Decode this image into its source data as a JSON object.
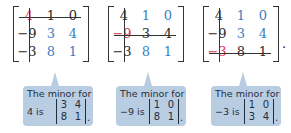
{
  "matrices": [
    {
      "rows": [
        [
          "4",
          "1",
          "0"
        ],
        [
          "-9",
          "3",
          "4"
        ],
        [
          "-3",
          "8",
          "1"
        ]
      ],
      "highlight": {
        "row": 0,
        "col": 0,
        "value": "4"
      },
      "crossed_row": 0,
      "crossed_col": 0
    },
    {
      "rows": [
        [
          "4",
          "1",
          "0"
        ],
        [
          "-9",
          "3",
          "4"
        ],
        [
          "-3",
          "8",
          "1"
        ]
      ],
      "highlight": {
        "row": 1,
        "col": 0,
        "value": "-9"
      },
      "crossed_row": 1,
      "crossed_col": 0
    },
    {
      "rows": [
        [
          "4",
          "1",
          "0"
        ],
        [
          "-9",
          "3",
          "4"
        ],
        [
          "-3",
          "8",
          "1"
        ]
      ],
      "highlight": {
        "row": 2,
        "col": 0,
        "value": "-3"
      },
      "crossed_row": 2,
      "crossed_col": 0,
      "trailing_punctuation": "."
    }
  ],
  "callouts": [
    {
      "title": "The minor for",
      "lead": "4 is",
      "minor": [
        [
          "3",
          "4"
        ],
        [
          "8",
          "1"
        ]
      ],
      "punctuation": "."
    },
    {
      "title": "The minor for",
      "lead": "−9 is",
      "minor": [
        [
          "1",
          "0"
        ],
        [
          "8",
          "1"
        ]
      ],
      "punctuation": "."
    },
    {
      "title": "The minor for",
      "lead": "−3 is",
      "minor": [
        [
          "1",
          "0"
        ],
        [
          "3",
          "4"
        ]
      ],
      "punctuation": "."
    }
  ],
  "display": {
    "m0": {
      "r0": [
        "4",
        "1",
        "0"
      ],
      "r1": [
        "−9",
        "3",
        "4"
      ],
      "r2": [
        "−3",
        "8",
        "1"
      ]
    },
    "m1": {
      "r0": [
        "4",
        "1",
        "0"
      ],
      "r1": [
        "−9",
        "3",
        "4"
      ],
      "r2": [
        "−3",
        "8",
        "1"
      ]
    },
    "m2": {
      "r0": [
        "4",
        "1",
        "0"
      ],
      "r1": [
        "−9",
        "3",
        "4"
      ],
      "r2": [
        "−3",
        "8",
        "1"
      ]
    },
    "period": "."
  },
  "colors": {
    "entry_dark": "#2a2a2a",
    "entry_blue": "#3a7fc1",
    "entry_highlight": "#d8344a",
    "callout_bg": "#b9cde2"
  }
}
